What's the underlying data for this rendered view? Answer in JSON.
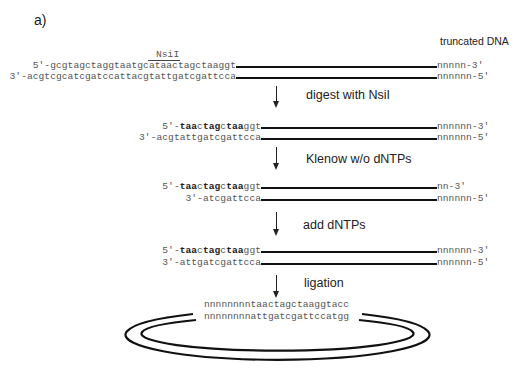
{
  "panel_label": "a)",
  "enzyme_label": "NsiI",
  "truncated_label": "truncated DNA",
  "steps": [
    {
      "name": "initial",
      "top": {
        "prefix": "5'-",
        "seq": "gcgtagctaggtaatgcataactagctaaggt",
        "end": "nnnnn-3'"
      },
      "bottom": {
        "prefix": "3'-",
        "seq": "acgtcgcatcgatccattacgtattgatcgattcca",
        "end": "nnnnnn-5'"
      }
    },
    {
      "name": "after-digest",
      "arrow_label": "digest with NsiI",
      "top": {
        "prefix": "5'-",
        "bold1": "taa",
        "mid1": "c",
        "bold2": "tag",
        "mid2": "c",
        "bold3": "taa",
        "tail": "ggt",
        "end": "nnnnnn-3'"
      },
      "bottom": {
        "prefix": "3'-",
        "seq": "acgtattgatcgattcca",
        "end": "nnnnnn-5'"
      }
    },
    {
      "name": "after-klenow",
      "arrow_label": "Klenow w/o dNTPs",
      "top": {
        "prefix": "5'-",
        "bold1": "taa",
        "mid1": "c",
        "bold2": "tag",
        "mid2": "c",
        "bold3": "taa",
        "tail": "ggt",
        "end": "nn-3'"
      },
      "bottom": {
        "prefix": "3'-",
        "seq": "atcgattcca",
        "end": "nnnnnn-5'"
      }
    },
    {
      "name": "after-dntps",
      "arrow_label": "add dNTPs",
      "top": {
        "prefix": "5'-",
        "bold1": "taa",
        "mid1": "c",
        "bold2": "tag",
        "mid2": "c",
        "bold3": "taa",
        "tail": "ggt",
        "end": "nnnnnn-3'"
      },
      "bottom": {
        "prefix": "3'-",
        "seq": "attgatcgattcca",
        "end": "nnnnnn-5'"
      }
    }
  ],
  "ligation": {
    "arrow_label": "ligation",
    "top_seq": "nnnnnnnntaactagctaaggtacc",
    "bottom_seq": "nnnnnnnnattgatcgattccatgg"
  }
}
